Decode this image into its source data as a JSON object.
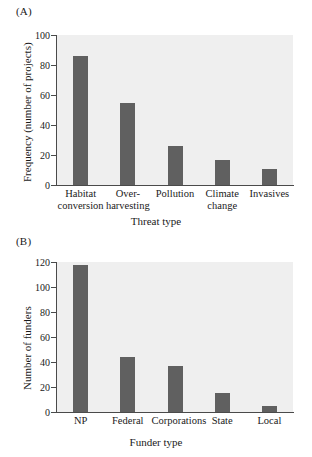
{
  "figure": {
    "panel_a_label": "(A)",
    "panel_b_label": "(B)"
  },
  "chart_data": [
    {
      "panel": "(A)",
      "type": "bar",
      "title": "",
      "xlabel": "Threat type",
      "ylabel": "Frequency (number of projects)",
      "categories": [
        "Habitat conversion",
        "Over-harvesting",
        "Pollution",
        "Climate change",
        "Invasives"
      ],
      "category_lines": [
        [
          "Habitat",
          "conversion"
        ],
        [
          "Over-",
          "harvesting"
        ],
        [
          "Pollution",
          ""
        ],
        [
          "Climate",
          "change"
        ],
        [
          "Invasives",
          ""
        ]
      ],
      "values": [
        86,
        55,
        26,
        17,
        11
      ],
      "ylim": [
        0,
        100
      ],
      "yticks": [
        0,
        20,
        40,
        60,
        80,
        100
      ],
      "ytick_labels": [
        "0",
        "20",
        "40",
        "60",
        "80",
        "100"
      ],
      "grid": false,
      "legend": "none",
      "bar_color": "#606060",
      "plot_bg": "#efefef"
    },
    {
      "panel": "(B)",
      "type": "bar",
      "title": "",
      "xlabel": "Funder type",
      "ylabel": "Number of funders",
      "categories": [
        "NP",
        "Federal",
        "Corporations",
        "State",
        "Local"
      ],
      "category_lines": [
        [
          "NP",
          ""
        ],
        [
          "Federal",
          ""
        ],
        [
          "Corporations",
          ""
        ],
        [
          "State",
          ""
        ],
        [
          "Local",
          ""
        ]
      ],
      "values": [
        118,
        44,
        37,
        15,
        5
      ],
      "ylim": [
        0,
        120
      ],
      "yticks": [
        0,
        20,
        40,
        60,
        80,
        100,
        120
      ],
      "ytick_labels": [
        "0",
        "20",
        "40",
        "60",
        "80",
        "100",
        "120"
      ],
      "grid": false,
      "legend": "none",
      "bar_color": "#606060",
      "plot_bg": "#efefef"
    }
  ]
}
